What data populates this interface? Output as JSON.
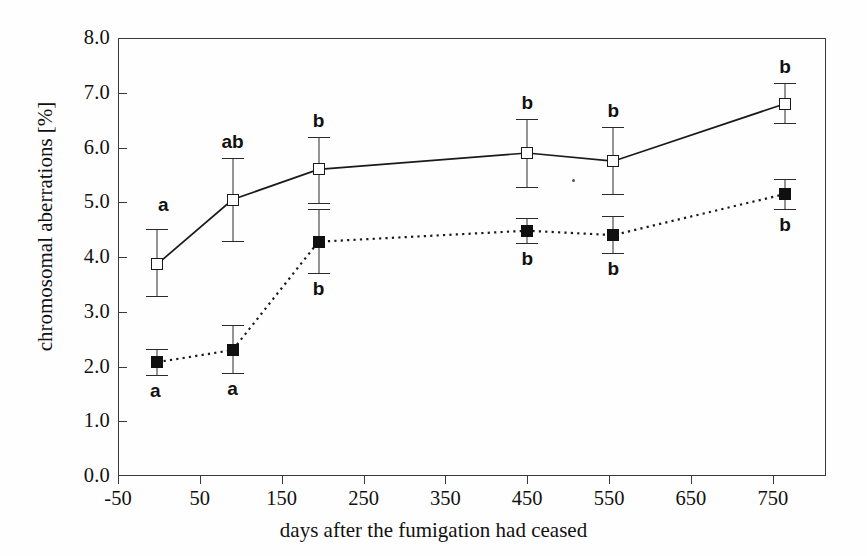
{
  "chart_data": {
    "type": "line",
    "title": "",
    "subtitle": "",
    "xlabel": "days after the fumigation had ceased",
    "ylabel": "chromosomal aberrations [%]",
    "xlim": [
      -50,
      815
    ],
    "ylim": [
      0.0,
      8.0
    ],
    "grid": false,
    "legend_position": "none",
    "xticks": [
      -50,
      50,
      150,
      250,
      350,
      450,
      550,
      650,
      750
    ],
    "xtick_labels": [
      "-50",
      "50",
      "150",
      "250",
      "350",
      "450",
      "550",
      "650",
      "750"
    ],
    "yticks": [
      0.0,
      1.0,
      2.0,
      3.0,
      4.0,
      5.0,
      6.0,
      7.0,
      8.0
    ],
    "ytick_labels": [
      "0.0",
      "1.0",
      "2.0",
      "3.0",
      "4.0",
      "5.0",
      "6.0",
      "7.0",
      "8.0"
    ],
    "x": [
      -2,
      90,
      195,
      450,
      555,
      765
    ],
    "series": [
      {
        "name": "open-square-series",
        "marker": "open-square",
        "line_style": "solid",
        "values": [
          3.87,
          5.05,
          5.6,
          5.9,
          5.75,
          6.8
        ],
        "error_low": [
          3.28,
          4.3,
          4.98,
          5.28,
          5.15,
          6.45
        ],
        "error_high": [
          4.52,
          5.8,
          6.2,
          6.52,
          6.38,
          7.18
        ],
        "sig_letters": [
          "a",
          "ab",
          "b",
          "b",
          "b",
          "b"
        ],
        "sig_position": [
          "above",
          "above",
          "above",
          "above",
          "above",
          "above"
        ]
      },
      {
        "name": "filled-square-series",
        "marker": "filled-square",
        "line_style": "dotted",
        "values": [
          2.08,
          2.3,
          4.28,
          4.48,
          4.4,
          5.15
        ],
        "error_low": [
          1.85,
          1.88,
          3.7,
          4.25,
          4.08,
          4.88
        ],
        "error_high": [
          2.32,
          2.75,
          4.88,
          4.72,
          4.75,
          5.42
        ],
        "sig_letters": [
          "a",
          "a",
          "b",
          "b",
          "b",
          "b"
        ],
        "sig_position": [
          "below",
          "below",
          "below",
          "below",
          "below",
          "below"
        ]
      }
    ]
  }
}
